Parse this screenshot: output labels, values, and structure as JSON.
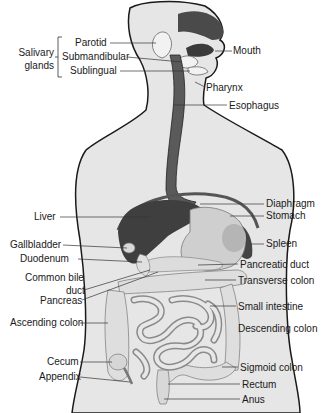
{
  "diagram": {
    "group_label": {
      "line1": "Salivary",
      "line2": "glands"
    },
    "labels_left": [
      {
        "id": "parotid",
        "text": "Parotid"
      },
      {
        "id": "submandibular",
        "text": "Submandibular"
      },
      {
        "id": "sublingual",
        "text": "Sublingual"
      },
      {
        "id": "liver",
        "text": "Liver"
      },
      {
        "id": "gallbladder",
        "text": "Gallbladder"
      },
      {
        "id": "duodenum",
        "text": "Duodenum"
      },
      {
        "id": "common_bile_duct_1",
        "text": "Common bile"
      },
      {
        "id": "common_bile_duct_2",
        "text": "duct"
      },
      {
        "id": "pancreas",
        "text": "Pancreas"
      },
      {
        "id": "ascending_colon",
        "text": "Ascending colon"
      },
      {
        "id": "cecum",
        "text": "Cecum"
      },
      {
        "id": "appendix",
        "text": "Appendix"
      }
    ],
    "labels_right": [
      {
        "id": "mouth",
        "text": "Mouth"
      },
      {
        "id": "pharynx",
        "text": "Pharynx"
      },
      {
        "id": "esophagus",
        "text": "Esophagus"
      },
      {
        "id": "diaphragm",
        "text": "Diaphragm"
      },
      {
        "id": "stomach",
        "text": "Stomach"
      },
      {
        "id": "spleen",
        "text": "Spleen"
      },
      {
        "id": "pancreatic_duct",
        "text": "Pancreatic duct"
      },
      {
        "id": "transverse_colon",
        "text": "Transverse colon"
      },
      {
        "id": "small_intestine",
        "text": "Small intestine"
      },
      {
        "id": "descending_colon",
        "text": "Descending colon"
      },
      {
        "id": "sigmoid_colon",
        "text": "Sigmoid colon"
      },
      {
        "id": "rectum",
        "text": "Rectum"
      },
      {
        "id": "anus",
        "text": "Anus"
      }
    ],
    "colors": {
      "body_fill": "#e6e6e6",
      "outline": "#1a1a1a",
      "dark_organ": "#4a4a4a",
      "light_organ": "#d2d2d2",
      "leader_line": "#333333"
    }
  }
}
